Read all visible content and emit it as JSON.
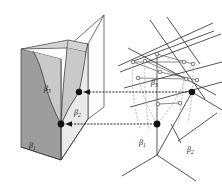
{
  "figure": {
    "name": "wall-crossing-structure-and-dual-line-arrangement",
    "background_color": "#ffffff",
    "panels": [
      {
        "id": "left-panel",
        "name": "three-dimensional-wall-structure",
        "description": "Folded book-like 3D diagram with three shaded chamber regions separated by curved walls",
        "labels": [
          {
            "id": "left-beta3",
            "text": "β3",
            "base": "β",
            "sub": "3",
            "x": 46,
            "y": 89
          },
          {
            "id": "left-beta2",
            "text": "β2",
            "base": "β",
            "sub": "2",
            "x": 76,
            "y": 113
          },
          {
            "id": "left-beta1",
            "text": "β1",
            "base": "β",
            "sub": "1",
            "x": 31,
            "y": 146
          }
        ],
        "vertices": [
          {
            "id": "left-node-upper",
            "x": 79,
            "y": 92,
            "r": 3.2,
            "color": "#111111"
          },
          {
            "id": "left-node-lower",
            "x": 61,
            "y": 124,
            "r": 3.4,
            "color": "#111111"
          }
        ],
        "shading": {
          "front_left_face": "#9d9d9d",
          "mid_chamber": "#c9c9c9",
          "light_chamber": "#e8e8e8",
          "top_strip": "#d4d4d4",
          "back_plane": "#fdfdfd"
        }
      },
      {
        "id": "right-panel",
        "name": "dual-tropical-line-arrangement",
        "description": "Planar arrangement of straight lines with small open circle intersection nodes, dashed arcs and two filled marked vertices",
        "labels": [
          {
            "id": "right-beta3",
            "text": "β3",
            "base": "β",
            "sub": "3",
            "x": 153,
            "y": 83
          },
          {
            "id": "right-beta1",
            "text": "β1",
            "base": "β",
            "sub": "1",
            "x": 141,
            "y": 143
          },
          {
            "id": "right-beta2",
            "text": "β2",
            "base": "β",
            "sub": "2",
            "x": 189,
            "y": 150
          }
        ],
        "vertices": [
          {
            "id": "right-node-upper",
            "x": 192,
            "y": 92,
            "r": 3.2,
            "color": "#111111"
          },
          {
            "id": "right-node-lower",
            "x": 157,
            "y": 124,
            "r": 3.4,
            "color": "#111111"
          }
        ],
        "open_nodes": [
          {
            "id": "onode-1",
            "x": 133,
            "y": 62
          },
          {
            "id": "onode-2",
            "x": 157,
            "y": 54
          },
          {
            "id": "onode-3",
            "x": 184,
            "y": 62
          },
          {
            "id": "onode-4",
            "x": 145,
            "y": 61
          },
          {
            "id": "onode-5",
            "x": 193,
            "y": 64
          },
          {
            "id": "onode-6",
            "x": 138,
            "y": 78
          },
          {
            "id": "onode-7",
            "x": 160,
            "y": 72
          },
          {
            "id": "onode-8",
            "x": 186,
            "y": 79
          },
          {
            "id": "onode-9",
            "x": 197,
            "y": 80
          },
          {
            "id": "onode-10",
            "x": 158,
            "y": 104
          },
          {
            "id": "onode-11",
            "x": 180,
            "y": 103
          }
        ]
      }
    ],
    "connectors": [
      {
        "id": "arrow-upper",
        "name": "dotted-arrow-upper",
        "style": "dotted-left-arrow",
        "from_x": 192,
        "from_y": 92,
        "to_x": 82,
        "to_y": 92,
        "color": "#1a1a1a"
      },
      {
        "id": "arrow-lower",
        "name": "dotted-arrow-lower",
        "style": "dotted-left-arrow",
        "from_x": 157,
        "from_y": 124,
        "to_x": 64,
        "to_y": 124,
        "color": "#1a1a1a"
      }
    ],
    "stroke_colors": {
      "outline": "#2b2b2b",
      "wall_curve": "#3a3a3a",
      "line_arrangement": "#2b2b2b",
      "dashed_arc": "#8a8a8a",
      "connector": "#1a1a1a"
    }
  }
}
